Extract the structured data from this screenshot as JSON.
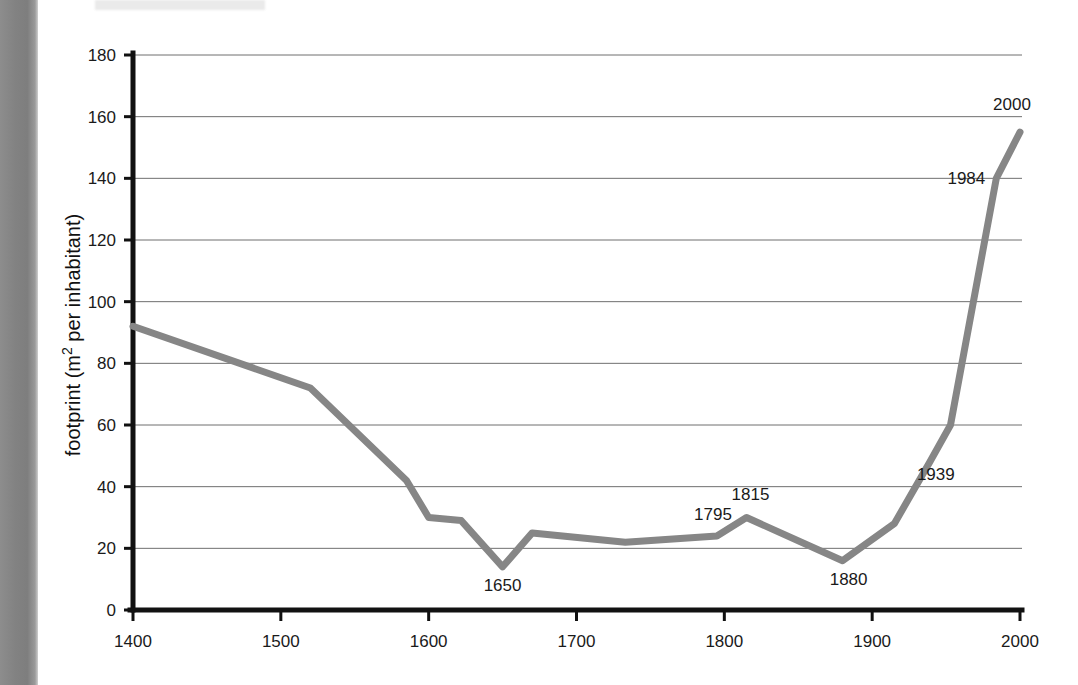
{
  "chart_data": {
    "type": "line",
    "title": "",
    "xlabel": "",
    "ylabel": "footprint (m² per inhabitant)",
    "xlim": [
      1400,
      2000
    ],
    "ylim": [
      0,
      180
    ],
    "xticks": [
      1400,
      1500,
      1600,
      1700,
      1800,
      1900,
      2000
    ],
    "xtick_labels": [
      "1400",
      "1500",
      "1600",
      "1700",
      "1800",
      "1900",
      "2000"
    ],
    "yticks": [
      0,
      20,
      40,
      60,
      80,
      100,
      120,
      140,
      160,
      180
    ],
    "ytick_labels": [
      "0",
      "20",
      "40",
      "60",
      "80",
      "100",
      "120",
      "140",
      "160",
      "180"
    ],
    "grid": true,
    "grid_axis": "y",
    "legend": false,
    "line_color": "#868686",
    "axis_color": "#111111",
    "grid_color": "#6f6f6f",
    "series": [
      {
        "name": "footprint",
        "x": [
          1400,
          1520,
          1585,
          1600,
          1622,
          1650,
          1670,
          1733,
          1795,
          1815,
          1880,
          1915,
          1939,
          1953,
          1984,
          2000
        ],
        "y": [
          92,
          72,
          42,
          30,
          29,
          14,
          25,
          22,
          24,
          30,
          16,
          28,
          48,
          60,
          140,
          155
        ]
      }
    ],
    "annotations": [
      {
        "label": "1650",
        "x": 1650,
        "y": 14,
        "dx": 0,
        "dy": 24,
        "anchor": "middle"
      },
      {
        "label": "1795",
        "x": 1795,
        "y": 24,
        "dx": -4,
        "dy": -16,
        "anchor": "middle"
      },
      {
        "label": "1815",
        "x": 1815,
        "y": 30,
        "dx": 4,
        "dy": -18,
        "anchor": "middle"
      },
      {
        "label": "1880",
        "x": 1880,
        "y": 16,
        "dx": 6,
        "dy": 24,
        "anchor": "middle"
      },
      {
        "label": "1939",
        "x": 1939,
        "y": 48,
        "dx": 6,
        "dy": 18,
        "anchor": "middle"
      },
      {
        "label": "1984",
        "x": 1984,
        "y": 140,
        "dx": -30,
        "dy": 6,
        "anchor": "middle"
      },
      {
        "label": "2000",
        "x": 2000,
        "y": 155,
        "dx": -8,
        "dy": -22,
        "anchor": "middle"
      }
    ]
  },
  "figure": {
    "background": "#ffffff",
    "scan_band_color": "#828282"
  }
}
